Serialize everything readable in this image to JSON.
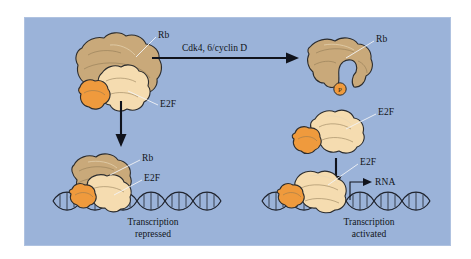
{
  "figure": {
    "background_color": "#9bb3d9",
    "outer_color": "#ffffff"
  },
  "colors": {
    "panel_background": "#9bb3d9",
    "rb_protein": "#c9a97a",
    "e2f_protein": "#f5dcb0",
    "orange_subunit": "#ef9a3d",
    "phosphate": "#ef9a3d",
    "dna": "#20242e",
    "arrow": "#10131c",
    "text": "#111418",
    "leader_line": "#f2f3f5"
  },
  "reaction_arrow": {
    "label": "Cdk4, 6/cyclin D",
    "direction": "right"
  },
  "top_left_complex": {
    "name": "rb-e2f-complex-free",
    "labels": {
      "rb": "Rb",
      "e2f": "E2F"
    }
  },
  "top_right_complex": {
    "name": "phosphorylated-rb",
    "labels": {
      "rb": "Rb"
    },
    "phosphate_glyph": "P"
  },
  "middle_right_complex": {
    "name": "free-e2f",
    "labels": {
      "e2f": "E2F"
    }
  },
  "bottom_left_complex": {
    "name": "rb-e2f-on-dna",
    "labels": {
      "rb": "Rb",
      "e2f": "E2F"
    },
    "caption_line1": "Transcription",
    "caption_line2": "repressed"
  },
  "bottom_right_complex": {
    "name": "e2f-on-dna",
    "labels": {
      "e2f": "E2F",
      "rna": "RNA"
    },
    "caption_line1": "Transcription",
    "caption_line2": "activated"
  },
  "vertical_arrows": [
    {
      "name": "left-downward-arrow",
      "direction": "down"
    },
    {
      "name": "right-downward-arrow",
      "direction": "down"
    }
  ],
  "dna_strands": [
    {
      "name": "dna-left",
      "description": "double helix under Rb-E2F complex"
    },
    {
      "name": "dna-right",
      "description": "double helix under E2F complex"
    }
  ]
}
